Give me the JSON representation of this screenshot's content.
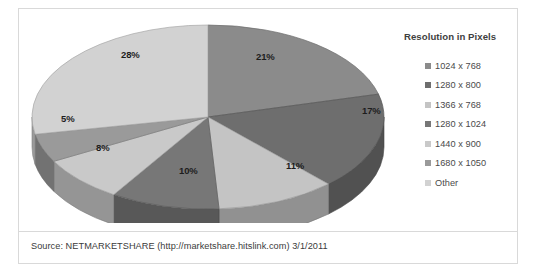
{
  "chart_data": {
    "type": "pie",
    "title": "",
    "legend_title": "Resolution in Pixels",
    "legend_position": "right",
    "grid": false,
    "categories": [
      "1024 x 768",
      "1280 x 800",
      "1366 x 768",
      "1280 x 1024",
      "1440 x 900",
      "1680 x 1050",
      "Other"
    ],
    "values": [
      21,
      17,
      11,
      10,
      8,
      5,
      28
    ],
    "value_labels": [
      "21%",
      "17%",
      "11%",
      "10%",
      "8%",
      "5%",
      "28%"
    ],
    "colors": [
      "#8b8b8b",
      "#6e6e6e",
      "#c4c4c4",
      "#777777",
      "#c9c9c9",
      "#9a9a9a",
      "#d2d2d2"
    ],
    "units": "percent",
    "xlabel": "",
    "ylabel": ""
  },
  "legend": {
    "title": "Resolution in Pixels",
    "items": [
      {
        "label": "1024 x 768",
        "color": "#8b8b8b"
      },
      {
        "label": "1280 x 800",
        "color": "#6e6e6e"
      },
      {
        "label": "1366 x 768",
        "color": "#c4c4c4"
      },
      {
        "label": "1280 x 1024",
        "color": "#777777"
      },
      {
        "label": "1440 x 900",
        "color": "#c9c9c9"
      },
      {
        "label": "1680 x 1050",
        "color": "#9a9a9a"
      },
      {
        "label": "Other",
        "color": "#d2d2d2"
      }
    ]
  },
  "slice_labels": [
    {
      "text": "21%",
      "x": 232,
      "y": 38
    },
    {
      "text": "17%",
      "x": 338,
      "y": 92
    },
    {
      "text": "11%",
      "x": 262,
      "y": 147
    },
    {
      "text": "10%",
      "x": 155,
      "y": 152
    },
    {
      "text": "8%",
      "x": 72,
      "y": 129
    },
    {
      "text": "5%",
      "x": 37,
      "y": 100
    },
    {
      "text": "28%",
      "x": 97,
      "y": 36
    }
  ],
  "footer": {
    "source": "Source: NETMARKETSHARE (http://marketshare.hitslink.com)    3/1/2011"
  }
}
